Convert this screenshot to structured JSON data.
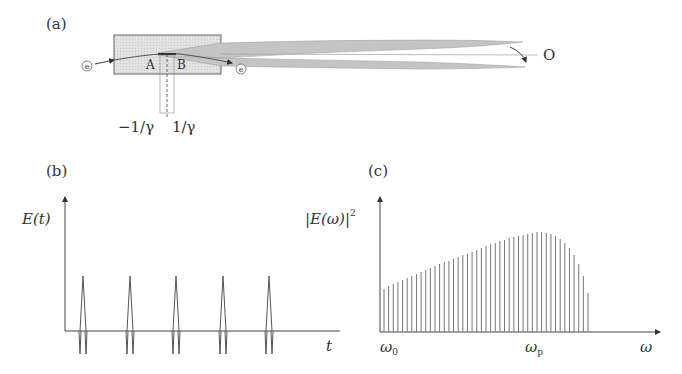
{
  "panel_a": {
    "label": "(a)",
    "electron_in": "e",
    "electron_out": "e",
    "point_a": "A",
    "point_b": "B",
    "observer": "O",
    "angle_neg": "−1/γ",
    "angle_pos": "1/γ"
  },
  "panel_b": {
    "label": "(b)",
    "ylabel": "E(t)",
    "xlabel": "t",
    "pulse_count": 5
  },
  "panel_c": {
    "label": "(c)",
    "ylabel": "|E(ω)|",
    "ylabel_sup": "2",
    "xlabel": "ω",
    "tick_start": "ω",
    "tick_start_sub": "0",
    "tick_peak": "ω",
    "tick_peak_sub": "p"
  },
  "chart_data": [
    {
      "type": "line",
      "title": "(b) Time-domain field of periodic pulses",
      "xlabel": "t",
      "ylabel": "E(t)",
      "x": [
        1,
        2,
        3,
        4,
        5
      ],
      "values": [
        1,
        1,
        1,
        1,
        1
      ],
      "note": "Five identical sharp positive spikes with small negative side-lobes, equally spaced"
    },
    {
      "type": "bar",
      "title": "(c) Frequency spectrum (harmonic lines)",
      "xlabel": "ω",
      "ylabel": "|E(ω)|^2",
      "tick_labels": [
        "ω0",
        "ωp"
      ],
      "values": [
        0.43,
        0.46,
        0.48,
        0.5,
        0.52,
        0.54,
        0.56,
        0.58,
        0.6,
        0.62,
        0.64,
        0.66,
        0.68,
        0.7,
        0.71,
        0.73,
        0.75,
        0.77,
        0.78,
        0.8,
        0.82,
        0.84,
        0.86,
        0.88,
        0.89,
        0.91,
        0.92,
        0.94,
        0.95,
        0.96,
        0.97,
        0.98,
        0.99,
        1.0,
        1.0,
        0.99,
        0.98,
        0.96,
        0.93,
        0.89,
        0.84,
        0.77,
        0.68,
        0.56,
        0.39
      ],
      "note": "Equally spaced harmonic lines starting at ω0, envelope rising to peak near ωp then falling sharply"
    }
  ]
}
